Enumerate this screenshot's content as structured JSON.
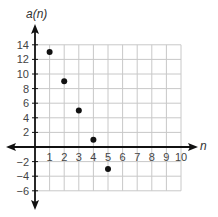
{
  "chart_data": {
    "type": "scatter",
    "title": "",
    "xlabel": "n",
    "ylabel": "a(n)",
    "xlim": [
      0,
      10
    ],
    "ylim": [
      -6,
      14
    ],
    "x_ticks": [
      1,
      2,
      3,
      4,
      5,
      6,
      7,
      8,
      9,
      10
    ],
    "y_ticks": [
      14,
      12,
      10,
      8,
      6,
      4,
      2,
      -2,
      -4,
      -6
    ],
    "grid": true,
    "points": [
      {
        "x": 1,
        "y": 13
      },
      {
        "x": 2,
        "y": 9
      },
      {
        "x": 3,
        "y": 5
      },
      {
        "x": 4,
        "y": 1
      },
      {
        "x": 5,
        "y": -3
      }
    ],
    "colors": {
      "axis": "#111111",
      "grid": "#c8c8c8",
      "point": "#111111",
      "text": "#444444"
    }
  }
}
